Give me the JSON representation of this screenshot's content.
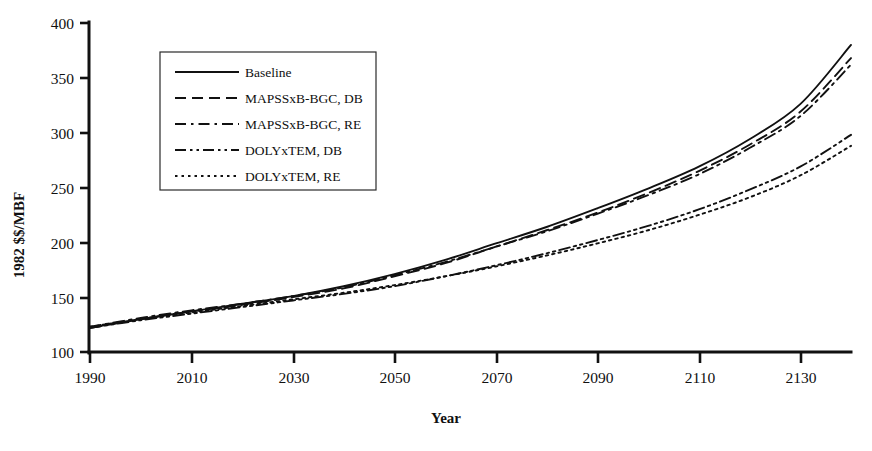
{
  "chart_data": {
    "type": "line",
    "title": "",
    "xlabel": "Year",
    "ylabel": "1982 $$/MBF",
    "xlim": [
      1990,
      2140
    ],
    "ylim": [
      100,
      400
    ],
    "xticks": [
      1990,
      2010,
      2030,
      2050,
      2070,
      2090,
      2110,
      2130
    ],
    "yticks": [
      100,
      150,
      200,
      250,
      300,
      350,
      400
    ],
    "grid": false,
    "legend_position": "upper-left-inside",
    "x": [
      1990,
      2000,
      2010,
      2020,
      2030,
      2040,
      2050,
      2060,
      2070,
      2080,
      2090,
      2100,
      2110,
      2120,
      2130,
      2140
    ],
    "series": [
      {
        "name": "Baseline",
        "dash": "solid",
        "values": [
          122,
          130,
          137,
          144,
          151,
          160,
          171,
          184,
          199,
          214,
          231,
          249,
          269,
          294,
          326,
          380
        ]
      },
      {
        "name": "MAPSSxB-BGC, DB",
        "dash": "dashed",
        "values": [
          122,
          130,
          137,
          143,
          150,
          158,
          169,
          181,
          196,
          211,
          227,
          245,
          265,
          289,
          319,
          368
        ]
      },
      {
        "name": "MAPSSxB-BGC, RE",
        "dash": "dash-dot",
        "values": [
          123,
          131,
          138,
          144,
          151,
          159,
          170,
          182,
          196,
          210,
          226,
          243,
          262,
          286,
          315,
          362
        ]
      },
      {
        "name": "DOLYxTEM, DB",
        "dash": "dash-dot-dot",
        "values": [
          122,
          129,
          135,
          141,
          147,
          153,
          160,
          169,
          179,
          190,
          202,
          215,
          230,
          248,
          269,
          298
        ]
      },
      {
        "name": "DOLYxTEM, RE",
        "dash": "dotted",
        "values": [
          123,
          130,
          136,
          142,
          148,
          154,
          161,
          169,
          178,
          188,
          199,
          211,
          225,
          241,
          261,
          288
        ]
      }
    ]
  },
  "axes": {
    "y_title": "1982 $$/MBF",
    "x_title": "Year",
    "y_tick_labels": [
      "400",
      "350",
      "300",
      "250",
      "200",
      "150",
      "100"
    ],
    "x_tick_labels": [
      "1990",
      "2010",
      "2030",
      "2050",
      "2070",
      "2090",
      "2110",
      "2130"
    ]
  },
  "legend": {
    "entries": [
      {
        "label": "Baseline"
      },
      {
        "label": "MAPSSxB-BGC, DB"
      },
      {
        "label": "MAPSSxB-BGC, RE"
      },
      {
        "label": "DOLYxTEM, DB"
      },
      {
        "label": "DOLYxTEM, RE"
      }
    ]
  },
  "colors": {
    "ink": "#111111",
    "background": "#ffffff"
  }
}
